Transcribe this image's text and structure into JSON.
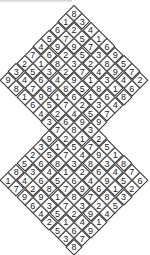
{
  "puzzle": {
    "type": "twin-diamond sudoku",
    "rows": [
      [
        "8"
      ],
      [
        "1",
        "3"
      ],
      [
        "6",
        "2",
        "4"
      ],
      [
        "5",
        "7",
        "5",
        "1"
      ],
      [
        "4",
        "9",
        "9",
        "7",
        "6"
      ],
      [
        "7",
        "6",
        "2",
        "5",
        "3",
        "9"
      ],
      [
        "2",
        "1",
        "8",
        "3",
        "2",
        "8",
        "5"
      ],
      [
        "3",
        "5",
        "3",
        "2",
        "7",
        "4",
        "9",
        "7"
      ],
      [
        "9",
        "4",
        "6",
        "4",
        "9",
        "1",
        "3",
        "4",
        "2"
      ],
      [
        "8",
        "7",
        "8",
        "8",
        "5",
        "8",
        "1",
        "6"
      ],
      [
        "1",
        "9",
        "1",
        "6",
        "1",
        "6",
        "8"
      ],
      [
        "6",
        "5",
        "7",
        "2",
        "3",
        "4"
      ],
      [
        "4",
        "2",
        "4",
        "5",
        "7"
      ],
      [
        "3",
        "6",
        "9",
        "9"
      ],
      [
        "7",
        "8",
        "3"
      ],
      [
        "9",
        "2",
        "1",
        "2"
      ],
      [
        "3",
        "1",
        "5",
        "7",
        "5"
      ],
      [
        "2",
        "5",
        "7",
        "4",
        "9",
        "1"
      ],
      [
        "5",
        "6",
        "8",
        "3",
        "8",
        "3",
        "8"
      ],
      [
        "8",
        "3",
        "4",
        "1",
        "2",
        "6",
        "4",
        "7"
      ],
      [
        "1",
        "4",
        "6",
        "5",
        "6",
        "4",
        "9",
        "5",
        "6"
      ],
      [
        "7",
        "2",
        "8",
        "7",
        "9",
        "6",
        "1",
        "2"
      ],
      [
        "9",
        "9",
        "1",
        "8",
        "7",
        "8",
        "3"
      ],
      [
        "6",
        "3",
        "7",
        "3",
        "2",
        "5"
      ],
      [
        "4",
        "5",
        "2",
        "9",
        "4"
      ],
      [
        "2",
        "1",
        "4",
        "1"
      ],
      [
        "5",
        "6",
        "9"
      ],
      [
        "3",
        "7"
      ],
      [
        "8"
      ]
    ],
    "colors": {
      "line": "#333333",
      "text": "#222222",
      "background": "#ffffff"
    }
  }
}
